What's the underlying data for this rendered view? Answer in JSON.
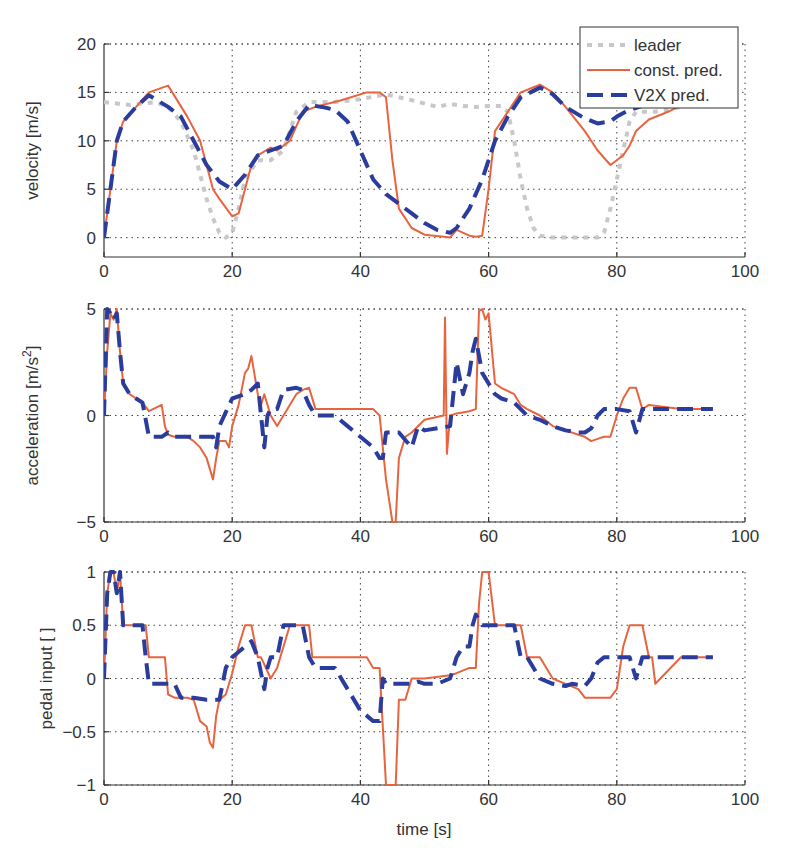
{
  "figure": {
    "xlabel": "time [s]",
    "legend": [
      {
        "label": "leader",
        "color": "#c8c8c8",
        "style": "dotted"
      },
      {
        "label": "const. pred.",
        "color": "#e8643f",
        "style": "solid"
      },
      {
        "label": "V2X pred.",
        "color": "#2a3d9c",
        "style": "dashed"
      }
    ]
  },
  "chart_data": [
    {
      "type": "line",
      "title": "",
      "xlabel": "",
      "ylabel": "velocity [m/s]",
      "xlim": [
        0,
        100
      ],
      "ylim": [
        -2,
        20
      ],
      "xticks": [
        0,
        20,
        40,
        60,
        80,
        100
      ],
      "yticks": [
        0,
        5,
        10,
        15,
        20
      ],
      "grid": true,
      "legend_position": "upper right",
      "series": [
        {
          "name": "leader",
          "x": [
            0,
            4,
            8,
            10,
            12,
            14,
            16,
            17,
            18,
            19,
            20,
            21,
            22,
            24,
            26,
            28,
            30,
            32,
            36,
            40,
            44,
            48,
            52,
            54,
            56,
            58,
            60,
            62,
            63,
            64,
            65,
            66,
            67,
            68,
            70,
            74,
            77,
            78,
            79,
            80,
            81,
            82,
            83,
            84,
            86,
            90,
            95
          ],
          "y": [
            14,
            13.7,
            14,
            13.5,
            12,
            9,
            4,
            2,
            0.5,
            0,
            0.5,
            3,
            6,
            8,
            8,
            9,
            13,
            14,
            14,
            14.3,
            14.8,
            14.2,
            13.5,
            13.8,
            13.6,
            13.5,
            13.6,
            13.6,
            13,
            10,
            6,
            3,
            1,
            0.2,
            0,
            0,
            0,
            0.5,
            3,
            6,
            9,
            12,
            13,
            13,
            13,
            13.5,
            14
          ]
        },
        {
          "name": "const. pred.",
          "x": [
            0,
            1,
            2,
            3,
            5,
            7,
            10,
            13,
            15,
            17,
            18,
            20,
            21,
            22,
            23,
            24,
            26,
            27,
            29,
            31,
            33,
            37,
            41,
            43,
            44,
            45,
            46,
            48,
            50,
            53,
            54,
            55,
            57,
            58,
            59,
            60,
            61,
            63,
            65,
            68,
            70,
            72,
            75,
            77,
            79,
            80,
            81,
            82,
            83,
            85,
            88,
            91,
            95
          ],
          "y": [
            0,
            5,
            10,
            12,
            13.5,
            15,
            15.7,
            12.5,
            10,
            5,
            4,
            2.2,
            2.5,
            5,
            7.5,
            8.5,
            9.3,
            9,
            10,
            13,
            13.5,
            14.2,
            15,
            15,
            14.5,
            8,
            3,
            1,
            0.3,
            0.1,
            0,
            0.8,
            0.2,
            0.1,
            0.2,
            5,
            11,
            13,
            15,
            15.8,
            15,
            13.5,
            11,
            9,
            7.5,
            8,
            8.5,
            9.5,
            11,
            12.2,
            13,
            14,
            14.5
          ]
        },
        {
          "name": "V2X pred.",
          "x": [
            0,
            1,
            2,
            3,
            5,
            7,
            10,
            12,
            14,
            16,
            18,
            20,
            22,
            24,
            26,
            28,
            30,
            32,
            34,
            36,
            38,
            40,
            42,
            44,
            46,
            48,
            50,
            52,
            54,
            55,
            57,
            59,
            60,
            61,
            63,
            65,
            68,
            70,
            72,
            75,
            77,
            79,
            80,
            82,
            85,
            88,
            92,
            95
          ],
          "y": [
            0,
            5,
            10,
            12,
            13.5,
            14.7,
            13.5,
            12.5,
            10,
            7.5,
            5.8,
            5,
            6.5,
            8.5,
            9,
            9.5,
            12,
            13.7,
            13.5,
            13.2,
            12,
            9,
            6,
            4.5,
            3.5,
            2.5,
            1.5,
            0.8,
            0.5,
            1,
            3,
            6,
            8,
            10,
            12.5,
            14.5,
            15.5,
            14.8,
            13.5,
            12.3,
            11.8,
            12,
            12.5,
            13.2,
            13.8,
            14.2,
            14.6,
            15
          ]
        }
      ]
    },
    {
      "type": "line",
      "title": "",
      "xlabel": "",
      "ylabel": "acceleration [m/s^2]",
      "xlim": [
        0,
        100
      ],
      "ylim": [
        -5,
        5
      ],
      "xticks": [
        0,
        20,
        40,
        60,
        80,
        100
      ],
      "yticks": [
        -5,
        0,
        5
      ],
      "grid": true,
      "series": [
        {
          "name": "const. pred.",
          "x": [
            0,
            0.5,
            1,
            1.5,
            2,
            2.5,
            3,
            4,
            5,
            6,
            7,
            9,
            9.5,
            10,
            11,
            13,
            14,
            15,
            16,
            17,
            17.5,
            18,
            19,
            19.5,
            20,
            21,
            22,
            22.5,
            23,
            24,
            24.5,
            25,
            26,
            27,
            28,
            30,
            31,
            32,
            33,
            36,
            40,
            42,
            43,
            44,
            45,
            45.5,
            46,
            47,
            48,
            50,
            53,
            53.2,
            53.5,
            54,
            55,
            57,
            58,
            58.5,
            59,
            59.5,
            60,
            61,
            62,
            64,
            65,
            66,
            68,
            70,
            72,
            74,
            75,
            76,
            77,
            78,
            79,
            80,
            81,
            82,
            83,
            84,
            85,
            90,
            95
          ],
          "y": [
            0,
            3,
            4.8,
            4.5,
            5,
            3,
            1.5,
            1,
            0.8,
            0.6,
            0.2,
            0.5,
            -0.5,
            -0.9,
            -1,
            -1,
            -1.2,
            -1.5,
            -2,
            -3,
            -2,
            -1.2,
            -1.2,
            -1.5,
            -0.5,
            0.5,
            2,
            2.2,
            2.8,
            1,
            0.5,
            1,
            0,
            -0.5,
            0,
            1,
            1.2,
            1.3,
            0.3,
            0.3,
            0.3,
            0.3,
            0,
            -3,
            -5,
            -5,
            -2,
            -1,
            -0.8,
            -0.2,
            0,
            4.6,
            -1.8,
            0,
            0.1,
            0.2,
            0.3,
            4.9,
            5,
            4.5,
            4.8,
            1.5,
            1.3,
            1,
            0.5,
            0.3,
            0,
            -0.5,
            -0.7,
            -0.9,
            -1,
            -1.2,
            -1.1,
            -1,
            -1,
            0,
            0.8,
            1.3,
            1.3,
            0.3,
            0.5,
            0.3,
            0.3
          ]
        },
        {
          "name": "V2X pred.",
          "x": [
            0,
            0.5,
            1,
            1.5,
            2,
            2.5,
            3,
            4,
            5,
            6,
            7,
            9,
            10,
            11,
            13,
            15,
            16,
            17,
            17.5,
            18,
            20,
            22,
            23,
            24,
            25,
            25.5,
            26,
            27,
            28,
            30,
            31,
            32,
            33,
            34,
            36,
            38,
            40,
            42,
            43,
            43.5,
            44,
            46,
            48,
            49,
            50,
            52,
            54,
            55,
            56,
            57,
            57.5,
            58,
            59,
            60,
            61,
            62,
            64,
            65,
            66,
            68,
            70,
            72,
            74,
            75,
            76,
            77,
            78,
            79,
            80,
            82,
            83,
            84,
            85,
            90,
            95
          ],
          "y": [
            0,
            5,
            4.8,
            4.5,
            4.8,
            3,
            1.5,
            1,
            0.8,
            0.6,
            -1,
            -1,
            -0.8,
            -1,
            -1,
            -1,
            -1,
            -1,
            -1.5,
            -0.5,
            0.8,
            1,
            1.2,
            1.5,
            -1.5,
            0,
            0.3,
            0.3,
            1.2,
            1.3,
            1.2,
            0.5,
            0,
            0,
            0,
            -0.5,
            -1,
            -1.5,
            -2,
            -2,
            -0.8,
            -0.8,
            -1.5,
            -0.5,
            -0.7,
            -0.6,
            -0.5,
            2.5,
            1,
            2,
            3,
            3.6,
            2,
            1.5,
            1,
            0.8,
            0.6,
            0.3,
            0,
            -0.2,
            -0.5,
            -0.7,
            -0.8,
            -0.8,
            -0.6,
            0,
            0.3,
            0.3,
            0.3,
            0.2,
            -0.8,
            0.3,
            0.3,
            0.3,
            0.3
          ]
        }
      ]
    },
    {
      "type": "line",
      "title": "",
      "xlabel": "time [s]",
      "ylabel": "pedal input [ ]",
      "xlim": [
        0,
        100
      ],
      "ylim": [
        -1,
        1
      ],
      "xticks": [
        0,
        20,
        40,
        60,
        80,
        100
      ],
      "yticks": [
        -1,
        -0.5,
        0,
        0.5,
        1
      ],
      "grid": true,
      "series": [
        {
          "name": "const. pred.",
          "x": [
            0,
            0.5,
            1,
            1.5,
            2,
            2.5,
            3,
            4,
            6.5,
            7,
            9.5,
            10,
            11,
            13,
            14,
            15,
            16,
            16.5,
            17,
            17.5,
            18,
            19,
            20,
            21,
            22,
            23,
            24,
            24.5,
            26,
            27,
            29,
            30,
            31,
            32,
            32.5,
            40,
            41,
            42,
            43,
            44,
            45.5,
            46,
            47,
            48,
            50,
            54,
            55,
            57,
            58,
            58.5,
            59,
            60,
            61,
            62,
            63,
            65,
            66,
            68,
            70,
            72,
            74,
            75,
            77,
            79,
            80,
            81,
            82,
            83,
            84,
            85,
            85.5,
            86,
            90,
            95
          ],
          "y": [
            0,
            0.8,
            1,
            1,
            0.8,
            1,
            0.5,
            0.5,
            0.5,
            0.2,
            0.2,
            -0.15,
            -0.18,
            -0.18,
            -0.2,
            -0.4,
            -0.45,
            -0.6,
            -0.65,
            -0.35,
            -0.2,
            -0.15,
            0.05,
            0.3,
            0.5,
            0.5,
            0.2,
            0.2,
            0,
            0.1,
            0.5,
            0.5,
            0.5,
            0.5,
            0.2,
            0.2,
            0.2,
            0.1,
            0.1,
            -1,
            -1,
            -0.2,
            -0.2,
            0,
            0,
            0.03,
            0.05,
            0.1,
            0.1,
            0.7,
            1,
            1,
            0.5,
            0.5,
            0.5,
            0.5,
            0.2,
            0.2,
            0,
            -0.05,
            -0.1,
            -0.18,
            -0.18,
            -0.18,
            -0.1,
            0.3,
            0.5,
            0.5,
            0.5,
            0.2,
            0.2,
            -0.05,
            0.2,
            0.2,
            0.2
          ]
        },
        {
          "name": "V2X pred.",
          "x": [
            0,
            0.5,
            1,
            1.5,
            2,
            2.5,
            3,
            4,
            6,
            6.5,
            7,
            10,
            11,
            12,
            14,
            16,
            18,
            19,
            20,
            22,
            23,
            24,
            25,
            25.5,
            26,
            27,
            28,
            29,
            30,
            31,
            32,
            33,
            34,
            36,
            38,
            40,
            42,
            43,
            43.5,
            44,
            46,
            48,
            49,
            50,
            52,
            54,
            55,
            56,
            57,
            57.5,
            58,
            59,
            60,
            62,
            64,
            65,
            66,
            68,
            70,
            72,
            73,
            75,
            76,
            77,
            78,
            79,
            80,
            82,
            83,
            84,
            85,
            90,
            95
          ],
          "y": [
            0,
            0.8,
            1,
            1,
            0.8,
            1,
            0.5,
            0.5,
            0.5,
            0.2,
            -0.05,
            -0.05,
            -0.05,
            -0.18,
            -0.18,
            -0.2,
            -0.2,
            0.1,
            0.2,
            0.3,
            0.35,
            0.2,
            -0.1,
            0.1,
            0.2,
            0.2,
            0.5,
            0.5,
            0.5,
            0.5,
            0.2,
            0.1,
            0.1,
            0.1,
            -0.1,
            -0.3,
            -0.4,
            -0.4,
            0,
            -0.05,
            -0.05,
            -0.05,
            -0.03,
            -0.05,
            -0.05,
            0,
            0.2,
            0.3,
            0.3,
            0.5,
            0.6,
            0.5,
            0.5,
            0.5,
            0.5,
            0.2,
            0.2,
            0,
            -0.05,
            -0.07,
            -0.05,
            -0.07,
            0,
            0.15,
            0.2,
            0.2,
            0.2,
            0.2,
            0,
            0.2,
            0.2,
            0.2,
            0.2
          ]
        }
      ]
    }
  ]
}
